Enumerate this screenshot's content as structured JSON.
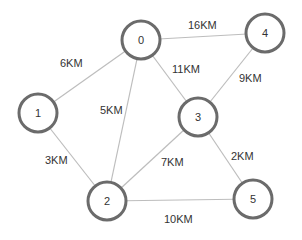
{
  "graph": {
    "nodes": [
      {
        "id": "0",
        "label": "0",
        "x": 141,
        "y": 40
      },
      {
        "id": "1",
        "label": "1",
        "x": 38,
        "y": 113
      },
      {
        "id": "2",
        "label": "2",
        "x": 107,
        "y": 201
      },
      {
        "id": "3",
        "label": "3",
        "x": 198,
        "y": 117
      },
      {
        "id": "4",
        "label": "4",
        "x": 265,
        "y": 33
      },
      {
        "id": "5",
        "label": "5",
        "x": 253,
        "y": 199
      }
    ],
    "edges": [
      {
        "from": "0",
        "to": "1",
        "label": "6KM",
        "lx": 60,
        "ly": 67
      },
      {
        "from": "0",
        "to": "4",
        "label": "16KM",
        "lx": 188,
        "ly": 29
      },
      {
        "from": "0",
        "to": "2",
        "label": "5KM",
        "lx": 100,
        "ly": 114
      },
      {
        "from": "0",
        "to": "3",
        "label": "11KM",
        "lx": 172,
        "ly": 73
      },
      {
        "from": "4",
        "to": "3",
        "label": "9KM",
        "lx": 239,
        "ly": 82
      },
      {
        "from": "1",
        "to": "2",
        "label": "3KM",
        "lx": 45,
        "ly": 164
      },
      {
        "from": "3",
        "to": "2",
        "label": "7KM",
        "lx": 161,
        "ly": 166
      },
      {
        "from": "3",
        "to": "5",
        "label": "2KM",
        "lx": 231,
        "ly": 160
      },
      {
        "from": "2",
        "to": "5",
        "label": "10KM",
        "lx": 164,
        "ly": 223
      }
    ]
  },
  "style": {
    "node_radius": 19,
    "node_stroke": "#6b6b6b",
    "edge_stroke": "#bdbdbd",
    "text_color": "#333333"
  }
}
